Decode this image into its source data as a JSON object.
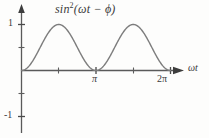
{
  "figure": {
    "width": 209,
    "height": 138,
    "background_color": "#fdfdfc",
    "title_text": "sin2(ωt − ϕ)",
    "title_base": "sin",
    "title_exponent": "2",
    "title_argument": "(ωt − ϕ)"
  },
  "axes": {
    "x_axis_label": "ωt",
    "y_axis_label": "",
    "x_tick_labels": [
      "π",
      "2π"
    ],
    "x_tick_values": [
      3.14159,
      6.28319
    ],
    "y_tick_labels": [
      "1",
      "",
      "",
      "",
      "-1"
    ],
    "y_tick_values": [
      1,
      0.5,
      0,
      -0.5,
      -1
    ],
    "y_labeled": [
      "1",
      "-1"
    ],
    "x_axis_color": "#4a4a4a",
    "y_axis_color": "#4a4a4a",
    "arrow_heads": [
      "y-axis-up",
      "x-axis-right"
    ]
  },
  "chart_data": {
    "type": "line",
    "xlabel": "ωt",
    "ylabel": "",
    "xlim": [
      0,
      7.3
    ],
    "ylim": [
      -1.3,
      1.35
    ],
    "grid": false,
    "legend": "none",
    "line_color": "#7d7d7d",
    "line_width": 1.4,
    "series": [
      {
        "name": "sin^2(ωt − ϕ)",
        "function": "sin^2(x)",
        "phase_phi": 0,
        "x": [
          0,
          0.1963,
          0.3927,
          0.589,
          0.7854,
          0.9817,
          1.1781,
          1.3744,
          1.5708,
          1.7671,
          1.9635,
          2.1598,
          2.3562,
          2.5525,
          2.7489,
          2.9452,
          3.1416,
          3.3379,
          3.5343,
          3.7306,
          3.927,
          4.1233,
          4.3197,
          4.516,
          4.7124,
          4.9087,
          5.1051,
          5.3014,
          5.4978,
          5.6941,
          5.8905,
          6.0868,
          6.2832
        ],
        "y": [
          0,
          0.0381,
          0.1464,
          0.3087,
          0.5,
          0.6913,
          0.8536,
          0.9619,
          1,
          0.9619,
          0.8536,
          0.6913,
          0.5,
          0.3087,
          0.1464,
          0.0381,
          0,
          0.0381,
          0.1464,
          0.3087,
          0.5,
          0.6913,
          0.8536,
          0.9619,
          1,
          0.9619,
          0.8536,
          0.6913,
          0.5,
          0.3087,
          0.1464,
          0.0381,
          0
        ],
        "zeros": [
          0,
          3.14159,
          6.28319
        ],
        "peaks": [
          {
            "x": 1.5708,
            "y": 1
          },
          {
            "x": 4.7124,
            "y": 1
          }
        ],
        "period": 3.14159,
        "amplitude": 1,
        "minimum": 0,
        "maximum": 1
      }
    ]
  }
}
